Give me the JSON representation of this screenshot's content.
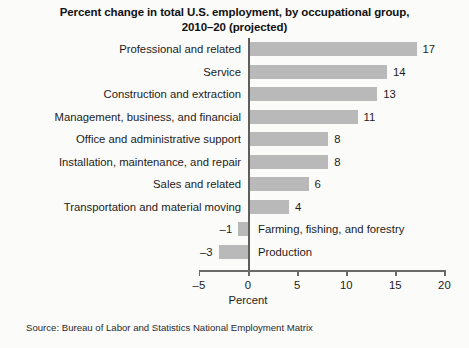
{
  "chart_data": {
    "type": "bar",
    "orientation": "horizontal",
    "title": "Percent change in total U.S. employment, by occupational group, 2010–20 (projected)",
    "title_line1": "Percent change in total U.S. employment, by occupational group,",
    "title_line2": "2010–20 (projected)",
    "categories": [
      "Professional and related",
      "Service",
      "Construction and extraction",
      "Management, business, and financial",
      "Office and administrative support",
      "Installation, maintenance, and repair",
      "Sales and related",
      "Transportation and material moving",
      "Farming, fishing, and forestry",
      "Production"
    ],
    "values": [
      17,
      14,
      13,
      11,
      8,
      8,
      6,
      4,
      -1,
      -3
    ],
    "value_labels": [
      "17",
      "14",
      "13",
      "11",
      "8",
      "8",
      "6",
      "4",
      "–1",
      "–3"
    ],
    "xlabel": "Percent",
    "ylabel": "",
    "xlim": [
      -5,
      20
    ],
    "xticks": [
      -5,
      0,
      5,
      10,
      15,
      20
    ],
    "xtick_labels": [
      "–5",
      "0",
      "5",
      "10",
      "15",
      "20"
    ],
    "grid": false,
    "legend": "none",
    "bar_color": "#b9b9b9",
    "axis_color": "#6a6a6a",
    "background_color": "#fbfbfa",
    "source": "Source: Bureau of Labor and Statistics National Employment Matrix"
  }
}
